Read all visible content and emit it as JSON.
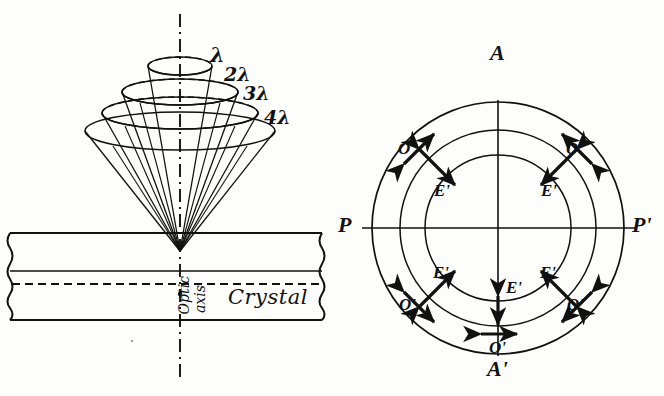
{
  "figure": {
    "ink_color": "#111111",
    "background_color": "#fdfdfc"
  },
  "left_panel": {
    "name": "conical-refraction-diagram",
    "wavelength_labels": [
      {
        "text": "λ",
        "x": 212,
        "y": 48
      },
      {
        "text": "2λ",
        "x": 226,
        "y": 68
      },
      {
        "text": "3λ",
        "x": 243,
        "y": 86
      },
      {
        "text": "4λ",
        "x": 264,
        "y": 110
      }
    ],
    "crystal_label": "Crystal",
    "optic_axis_label_1": "Optic",
    "optic_axis_label_2": "axis",
    "cones": [
      {
        "order": 1,
        "label": "λ",
        "rim_cx": 180,
        "rim_cy": 66,
        "rim_rx": 32,
        "rim_ry": 9
      },
      {
        "order": 2,
        "label": "2λ",
        "rim_cx": 180,
        "rim_cy": 92,
        "rim_rx": 58,
        "rim_ry": 13
      },
      {
        "order": 3,
        "label": "3λ",
        "rim_cx": 180,
        "rim_cy": 113,
        "rim_rx": 78,
        "rim_ry": 16
      },
      {
        "order": 4,
        "label": "4λ",
        "rim_cx": 180,
        "rim_cy": 131,
        "rim_rx": 95,
        "rim_ry": 19
      }
    ],
    "apex": {
      "x": 180,
      "y": 251
    },
    "slab": {
      "left": 8,
      "right": 324,
      "top": 233,
      "bottom": 320,
      "inner_line_y": 271,
      "dashed_axis_y": 284
    }
  },
  "right_panel": {
    "name": "ring-polarization-diagram",
    "center": {
      "x": 498,
      "y": 228
    },
    "radii": [
      73,
      98,
      126
    ],
    "axis_labels": [
      {
        "text": "A",
        "x": 492,
        "y": 44,
        "name": "axis-label-a"
      },
      {
        "text": "A'",
        "x": 490,
        "y": 362,
        "name": "axis-label-a-prime"
      },
      {
        "text": "P",
        "x": 341,
        "y": 215,
        "name": "axis-label-p"
      },
      {
        "text": "P'",
        "x": 634,
        "y": 215,
        "name": "axis-label-p-prime"
      }
    ],
    "polarization_marks": [
      {
        "label": "O'",
        "type": "tangential",
        "angle_deg": 135,
        "radius": 112,
        "lx": 402,
        "ly": 147
      },
      {
        "label": "O'",
        "type": "tangential",
        "angle_deg": 45,
        "radius": 112,
        "lx": 570,
        "ly": 147
      },
      {
        "label": "E'",
        "type": "radial",
        "angle_deg": 135,
        "radius": 86,
        "lx": 438,
        "ly": 188
      },
      {
        "label": "E'",
        "type": "radial",
        "angle_deg": 45,
        "radius": 86,
        "lx": 545,
        "ly": 188
      },
      {
        "label": "E'",
        "type": "radial",
        "angle_deg": 225,
        "radius": 86,
        "lx": 437,
        "ly": 272
      },
      {
        "label": "E'",
        "type": "radial",
        "angle_deg": 315,
        "radius": 86,
        "lx": 544,
        "ly": 272
      },
      {
        "label": "O'",
        "type": "tangential",
        "angle_deg": 225,
        "radius": 112,
        "lx": 403,
        "ly": 303
      },
      {
        "label": "O'",
        "type": "tangential",
        "angle_deg": 315,
        "radius": 112,
        "lx": 571,
        "ly": 303
      },
      {
        "label": "E'",
        "type": "radial",
        "angle_deg": 270,
        "radius": 88,
        "lx": 509,
        "ly": 286
      },
      {
        "label": "O'",
        "type": "tangential",
        "angle_deg": 270,
        "radius": 115,
        "lx": 491,
        "ly": 345
      }
    ]
  }
}
